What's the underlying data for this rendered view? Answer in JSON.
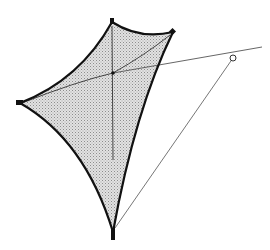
{
  "figure": {
    "title": "",
    "colors": {
      "background": "#ffffff",
      "edge_cable": "#111111",
      "membrane_fill": "#d9d9d9",
      "membrane_hatch": "#9a9a9a",
      "guy_line": "#555555",
      "anchor_point_fill": "#ffffff"
    },
    "elements": [
      "membrane-surface",
      "edge-cable-top",
      "edge-cable-right",
      "edge-cable-left-lower",
      "edge-cable-left-upper",
      "corner-top",
      "corner-right",
      "corner-left",
      "corner-bottom",
      "internal-cable-vertical",
      "internal-cable-diagonal",
      "guy-line-horizontal",
      "guy-line-diagonal",
      "anchor-point"
    ]
  }
}
